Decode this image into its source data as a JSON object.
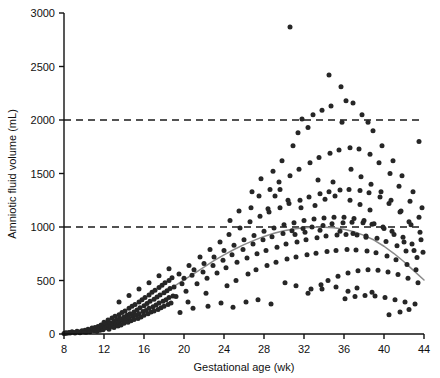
{
  "chart_data": {
    "type": "scatter",
    "title": "",
    "xlabel": "Gestational age (wk)",
    "ylabel": "Amniotic fluid volume (mL)",
    "xlim": [
      8,
      44
    ],
    "ylim": [
      0,
      3000
    ],
    "xticks": [
      8,
      12,
      16,
      20,
      24,
      28,
      32,
      36,
      40,
      44
    ],
    "xtick_labels": [
      "8",
      "12",
      "16",
      "20",
      "24",
      "28",
      "32",
      "36",
      "40",
      "44"
    ],
    "yticks": [
      0,
      500,
      1000,
      1500,
      2000,
      2500,
      3000
    ],
    "ytick_labels": [
      "0",
      "500",
      "1000",
      "1500",
      "2000",
      "2500",
      "3000"
    ],
    "grid": false,
    "legend": "none",
    "marker_color": "#262626",
    "marker_size": 5,
    "reference_lines": [
      {
        "y": 1000,
        "style": "dashed",
        "color": "#1a1a1a"
      },
      {
        "y": 2000,
        "style": "dashed",
        "color": "#1a1a1a"
      }
    ],
    "fit_curve": {
      "name": "smoothed mean",
      "color": "#8a8a8a",
      "x": [
        8,
        9,
        10,
        11,
        12,
        13,
        14,
        15,
        16,
        17,
        18,
        19,
        20,
        21,
        22,
        23,
        24,
        25,
        26,
        27,
        28,
        29,
        30,
        31,
        32,
        33,
        34,
        35,
        36,
        37,
        38,
        39,
        40,
        41,
        42,
        43,
        44
      ],
      "y": [
        10,
        20,
        35,
        55,
        80,
        115,
        160,
        210,
        265,
        325,
        385,
        445,
        505,
        565,
        625,
        685,
        740,
        790,
        835,
        875,
        912,
        942,
        965,
        982,
        993,
        998,
        998,
        992,
        978,
        955,
        922,
        878,
        820,
        752,
        675,
        590,
        505
      ]
    },
    "points": [
      [
        8.0,
        5
      ],
      [
        8.1,
        8
      ],
      [
        8.2,
        12
      ],
      [
        8.3,
        6
      ],
      [
        8.5,
        15
      ],
      [
        8.6,
        10
      ],
      [
        8.8,
        20
      ],
      [
        9.0,
        14
      ],
      [
        9.1,
        9
      ],
      [
        9.3,
        25
      ],
      [
        9.5,
        18
      ],
      [
        9.6,
        12
      ],
      [
        9.8,
        30
      ],
      [
        10.0,
        22
      ],
      [
        10.1,
        35
      ],
      [
        10.2,
        16
      ],
      [
        10.4,
        45
      ],
      [
        10.5,
        28
      ],
      [
        10.6,
        20
      ],
      [
        10.8,
        55
      ],
      [
        10.9,
        38
      ],
      [
        11.0,
        30
      ],
      [
        11.1,
        60
      ],
      [
        11.2,
        42
      ],
      [
        11.3,
        25
      ],
      [
        11.4,
        70
      ],
      [
        11.5,
        50
      ],
      [
        11.6,
        35
      ],
      [
        11.7,
        85
      ],
      [
        11.8,
        58
      ],
      [
        11.9,
        40
      ],
      [
        12.0,
        75
      ],
      [
        12.0,
        110
      ],
      [
        12.1,
        55
      ],
      [
        12.2,
        95
      ],
      [
        12.3,
        65
      ],
      [
        12.4,
        130
      ],
      [
        12.5,
        80
      ],
      [
        12.5,
        45
      ],
      [
        12.6,
        105
      ],
      [
        12.7,
        70
      ],
      [
        12.8,
        150
      ],
      [
        12.9,
        90
      ],
      [
        13.0,
        120
      ],
      [
        13.0,
        60
      ],
      [
        13.1,
        165
      ],
      [
        13.2,
        95
      ],
      [
        13.3,
        135
      ],
      [
        13.4,
        75
      ],
      [
        13.5,
        180
      ],
      [
        13.5,
        110
      ],
      [
        13.6,
        145
      ],
      [
        13.7,
        85
      ],
      [
        13.8,
        200
      ],
      [
        13.9,
        125
      ],
      [
        14.0,
        160
      ],
      [
        14.0,
        100
      ],
      [
        14.1,
        215
      ],
      [
        14.2,
        135
      ],
      [
        14.3,
        175
      ],
      [
        14.4,
        110
      ],
      [
        14.5,
        240
      ],
      [
        14.5,
        150
      ],
      [
        14.6,
        190
      ],
      [
        14.7,
        125
      ],
      [
        14.8,
        260
      ],
      [
        14.9,
        165
      ],
      [
        15.0,
        205
      ],
      [
        15.0,
        135
      ],
      [
        15.1,
        275
      ],
      [
        15.2,
        175
      ],
      [
        15.3,
        225
      ],
      [
        15.4,
        145
      ],
      [
        15.5,
        300
      ],
      [
        15.5,
        190
      ],
      [
        15.6,
        245
      ],
      [
        15.7,
        160
      ],
      [
        15.8,
        320
      ],
      [
        15.9,
        210
      ],
      [
        16.0,
        265
      ],
      [
        16.0,
        175
      ],
      [
        16.1,
        340
      ],
      [
        16.2,
        220
      ],
      [
        16.3,
        285
      ],
      [
        16.4,
        190
      ],
      [
        16.5,
        365
      ],
      [
        16.5,
        240
      ],
      [
        16.6,
        305
      ],
      [
        16.7,
        205
      ],
      [
        16.8,
        390
      ],
      [
        16.9,
        255
      ],
      [
        17.0,
        325
      ],
      [
        17.0,
        215
      ],
      [
        17.1,
        410
      ],
      [
        17.2,
        270
      ],
      [
        17.3,
        345
      ],
      [
        17.4,
        230
      ],
      [
        17.5,
        435
      ],
      [
        17.5,
        290
      ],
      [
        17.6,
        365
      ],
      [
        17.7,
        245
      ],
      [
        17.8,
        455
      ],
      [
        17.9,
        305
      ],
      [
        18.0,
        385
      ],
      [
        18.0,
        260
      ],
      [
        18.1,
        480
      ],
      [
        18.2,
        320
      ],
      [
        18.3,
        405
      ],
      [
        18.4,
        275
      ],
      [
        18.5,
        500
      ],
      [
        18.5,
        340
      ],
      [
        18.6,
        425
      ],
      [
        18.7,
        290
      ],
      [
        18.8,
        525
      ],
      [
        18.9,
        355
      ],
      [
        13.5,
        300
      ],
      [
        14.5,
        360
      ],
      [
        15.5,
        420
      ],
      [
        16.5,
        480
      ],
      [
        17.5,
        545
      ],
      [
        18.5,
        610
      ],
      [
        19.0,
        440
      ],
      [
        19.2,
        350
      ],
      [
        19.5,
        560
      ],
      [
        19.8,
        470
      ],
      [
        20.0,
        520
      ],
      [
        20.2,
        400
      ],
      [
        20.5,
        640
      ],
      [
        20.8,
        550
      ],
      [
        20.4,
        300
      ],
      [
        21.0,
        600
      ],
      [
        21.3,
        470
      ],
      [
        21.6,
        720
      ],
      [
        21.9,
        580
      ],
      [
        22.0,
        660
      ],
      [
        22.3,
        520
      ],
      [
        22.6,
        790
      ],
      [
        22.9,
        640
      ],
      [
        22.2,
        380
      ],
      [
        23.0,
        720
      ],
      [
        23.3,
        570
      ],
      [
        23.6,
        860
      ],
      [
        23.9,
        690
      ],
      [
        24.0,
        780
      ],
      [
        24.2,
        620
      ],
      [
        24.5,
        930
      ],
      [
        24.8,
        740
      ],
      [
        24.3,
        450
      ],
      [
        24.6,
        1060
      ],
      [
        25.0,
        830
      ],
      [
        25.3,
        670
      ],
      [
        25.6,
        990
      ],
      [
        25.9,
        790
      ],
      [
        25.2,
        500
      ],
      [
        26.0,
        880
      ],
      [
        26.3,
        710
      ],
      [
        26.6,
        1050
      ],
      [
        26.9,
        840
      ],
      [
        26.4,
        560
      ],
      [
        26.7,
        1180
      ],
      [
        27.0,
        920
      ],
      [
        27.3,
        750
      ],
      [
        27.6,
        1100
      ],
      [
        27.9,
        880
      ],
      [
        27.2,
        600
      ],
      [
        27.5,
        1290
      ],
      [
        28.0,
        960
      ],
      [
        28.2,
        780
      ],
      [
        28.5,
        1140
      ],
      [
        28.8,
        910
      ],
      [
        28.3,
        640
      ],
      [
        28.6,
        1350
      ],
      [
        28.9,
        1520
      ],
      [
        29.0,
        990
      ],
      [
        29.3,
        810
      ],
      [
        29.6,
        1180
      ],
      [
        29.9,
        940
      ],
      [
        29.2,
        670
      ],
      [
        29.5,
        1420
      ],
      [
        29.8,
        1620
      ],
      [
        30.0,
        1020
      ],
      [
        30.2,
        840
      ],
      [
        30.5,
        1220
      ],
      [
        30.8,
        965
      ],
      [
        30.3,
        700
      ],
      [
        30.6,
        1480
      ],
      [
        30.9,
        1760
      ],
      [
        30.6,
        2870
      ],
      [
        31.0,
        1040
      ],
      [
        31.3,
        860
      ],
      [
        31.6,
        1250
      ],
      [
        31.9,
        985
      ],
      [
        31.2,
        720
      ],
      [
        31.5,
        1540
      ],
      [
        31.8,
        2010
      ],
      [
        31.4,
        1880
      ],
      [
        32.0,
        1060
      ],
      [
        32.2,
        880
      ],
      [
        32.5,
        1280
      ],
      [
        32.8,
        1000
      ],
      [
        32.3,
        740
      ],
      [
        32.6,
        1600
      ],
      [
        32.9,
        2050
      ],
      [
        32.4,
        1930
      ],
      [
        32.7,
        420
      ],
      [
        33.0,
        1075
      ],
      [
        33.3,
        900
      ],
      [
        33.6,
        1310
      ],
      [
        33.9,
        1015
      ],
      [
        33.2,
        755
      ],
      [
        33.5,
        1650
      ],
      [
        33.8,
        2090
      ],
      [
        33.4,
        1440
      ],
      [
        33.7,
        460
      ],
      [
        34.0,
        1085
      ],
      [
        34.2,
        915
      ],
      [
        34.5,
        1330
      ],
      [
        34.8,
        1030
      ],
      [
        34.3,
        770
      ],
      [
        34.6,
        1690
      ],
      [
        34.9,
        1420
      ],
      [
        34.4,
        500
      ],
      [
        34.7,
        2130
      ],
      [
        35.0,
        1090
      ],
      [
        35.3,
        925
      ],
      [
        35.6,
        1345
      ],
      [
        35.9,
        1040
      ],
      [
        35.2,
        780
      ],
      [
        35.5,
        1720
      ],
      [
        35.8,
        1980
      ],
      [
        35.4,
        540
      ],
      [
        35.7,
        2310
      ],
      [
        36.0,
        1090
      ],
      [
        36.2,
        930
      ],
      [
        36.5,
        1350
      ],
      [
        36.8,
        1045
      ],
      [
        36.3,
        790
      ],
      [
        36.6,
        1740
      ],
      [
        36.9,
        2160
      ],
      [
        36.4,
        570
      ],
      [
        36.7,
        1540
      ],
      [
        36.1,
        330
      ],
      [
        37.0,
        1080
      ],
      [
        37.3,
        925
      ],
      [
        37.6,
        1340
      ],
      [
        37.9,
        1040
      ],
      [
        37.2,
        785
      ],
      [
        37.5,
        1730
      ],
      [
        37.8,
        2050
      ],
      [
        37.4,
        590
      ],
      [
        37.7,
        1470
      ],
      [
        37.1,
        350
      ],
      [
        38.0,
        1060
      ],
      [
        38.2,
        915
      ],
      [
        38.5,
        1320
      ],
      [
        38.8,
        1025
      ],
      [
        38.3,
        775
      ],
      [
        38.6,
        1680
      ],
      [
        38.9,
        1900
      ],
      [
        38.4,
        600
      ],
      [
        38.7,
        1400
      ],
      [
        38.1,
        360
      ],
      [
        39.0,
        1030
      ],
      [
        39.3,
        895
      ],
      [
        39.6,
        1280
      ],
      [
        39.9,
        1000
      ],
      [
        39.2,
        760
      ],
      [
        39.5,
        1600
      ],
      [
        39.8,
        1760
      ],
      [
        39.4,
        595
      ],
      [
        39.7,
        1330
      ],
      [
        39.1,
        355
      ],
      [
        40.0,
        985
      ],
      [
        40.2,
        865
      ],
      [
        40.5,
        1220
      ],
      [
        40.8,
        960
      ],
      [
        40.3,
        730
      ],
      [
        40.6,
        1500
      ],
      [
        40.9,
        1620
      ],
      [
        40.4,
        580
      ],
      [
        40.7,
        1250
      ],
      [
        40.1,
        340
      ],
      [
        40.5,
        180
      ],
      [
        41.0,
        930
      ],
      [
        41.3,
        825
      ],
      [
        41.6,
        1140
      ],
      [
        41.9,
        905
      ],
      [
        41.2,
        695
      ],
      [
        41.5,
        1380
      ],
      [
        41.8,
        1480
      ],
      [
        41.4,
        555
      ],
      [
        41.7,
        1150
      ],
      [
        41.1,
        320
      ],
      [
        41.6,
        205
      ],
      [
        42.0,
        860
      ],
      [
        42.2,
        775
      ],
      [
        42.5,
        1050
      ],
      [
        42.8,
        840
      ],
      [
        42.3,
        650
      ],
      [
        42.6,
        1240
      ],
      [
        42.9,
        1330
      ],
      [
        42.4,
        520
      ],
      [
        42.7,
        1020
      ],
      [
        42.1,
        300
      ],
      [
        42.5,
        230
      ],
      [
        43.0,
        780
      ],
      [
        43.3,
        715
      ],
      [
        43.6,
        950
      ],
      [
        43.9,
        765
      ],
      [
        43.2,
        600
      ],
      [
        43.5,
        1090
      ],
      [
        43.8,
        1180
      ],
      [
        43.4,
        480
      ],
      [
        43.7,
        880
      ],
      [
        43.1,
        280
      ],
      [
        43.5,
        1800
      ],
      [
        29.6,
        1350
      ],
      [
        30.4,
        1250
      ],
      [
        31.7,
        1180
      ],
      [
        33.1,
        1200
      ],
      [
        34.1,
        1260
      ],
      [
        35.1,
        1290
      ],
      [
        36.6,
        1250
      ],
      [
        37.6,
        1210
      ],
      [
        38.6,
        1160
      ],
      [
        25.5,
        1150
      ],
      [
        26.8,
        1330
      ],
      [
        27.7,
        1450
      ],
      [
        28.4,
        1170
      ],
      [
        29.1,
        1290
      ],
      [
        31.1,
        930
      ],
      [
        32.1,
        950
      ],
      [
        33.6,
        970
      ],
      [
        35.6,
        960
      ],
      [
        36.9,
        940
      ],
      [
        38.2,
        905
      ],
      [
        30.1,
        480
      ],
      [
        31.2,
        450
      ],
      [
        32.4,
        380
      ],
      [
        33.8,
        420
      ],
      [
        35.2,
        440
      ],
      [
        36.4,
        400
      ],
      [
        37.3,
        430
      ],
      [
        38.8,
        390
      ],
      [
        24.9,
        250
      ],
      [
        26.2,
        300
      ],
      [
        27.4,
        320
      ],
      [
        28.7,
        280
      ],
      [
        19.6,
        200
      ],
      [
        20.9,
        240
      ],
      [
        22.4,
        260
      ],
      [
        23.7,
        290
      ],
      [
        34.5,
        2420
      ],
      [
        36.2,
        2180
      ],
      [
        38.4,
        1980
      ]
    ]
  },
  "axes_geometry": {
    "plot_left_px": 64,
    "plot_right_px": 424,
    "plot_top_px": 13,
    "plot_bottom_px": 334
  }
}
